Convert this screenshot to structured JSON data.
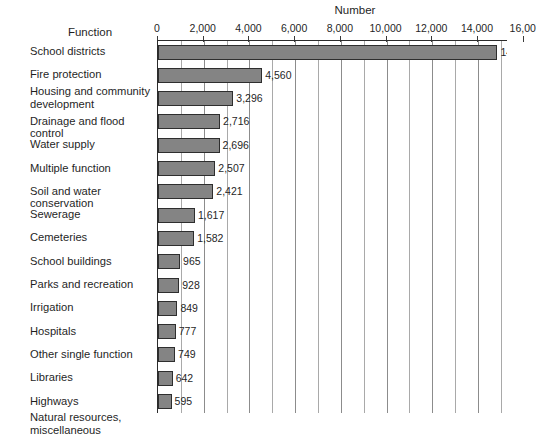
{
  "chart_data": {
    "type": "bar",
    "orientation": "horizontal",
    "title": "",
    "xlabel": "Number",
    "ylabel": "Function",
    "xlim": [
      0,
      16000
    ],
    "grid": true,
    "gridline_step": 1000,
    "tick_step": 2000,
    "legend": "none",
    "tick_labels": [
      "0",
      "2,000",
      "4,000",
      "6,000",
      "8,000",
      "10,000",
      "12,000",
      "14,000",
      "16,00"
    ],
    "tick_values": [
      0,
      2000,
      4000,
      6000,
      8000,
      10000,
      12000,
      14000,
      16000
    ],
    "categories": [
      "School districts",
      "Fire protection",
      "Housing and community development",
      "Drainage and flood control",
      "Water supply",
      "Multiple function",
      "Soil and water conservation",
      "Sewerage",
      "Cemeteries",
      "School buildings",
      "Parks and recreation",
      "Irrigation",
      "Hospitals",
      "Other single function",
      "Libraries",
      "Highways",
      "Natural resources, miscellaneous"
    ],
    "values": [
      14851,
      4560,
      3296,
      2716,
      2696,
      2507,
      2421,
      1617,
      1582,
      965,
      928,
      849,
      777,
      749,
      642,
      595,
      290
    ],
    "value_labels": [
      "14,851",
      "4,560",
      "3,296",
      "2,716",
      "2,696",
      "2,507",
      "2,421",
      "1,617",
      "1,582",
      "965",
      "928",
      "849",
      "777",
      "749",
      "642",
      "595",
      "290"
    ],
    "bars": [
      {
        "label": "School districts",
        "label_lines": [
          "School districts"
        ],
        "value": 14851,
        "value_label": "14,851"
      },
      {
        "label": "Fire protection",
        "label_lines": [
          "Fire protection"
        ],
        "value": 4560,
        "value_label": "4,560"
      },
      {
        "label": "Housing and community development",
        "label_lines": [
          "Housing and community",
          "development"
        ],
        "value": 3296,
        "value_label": "3,296"
      },
      {
        "label": "Drainage and flood control",
        "label_lines": [
          "Drainage and flood control"
        ],
        "value": 2716,
        "value_label": "2,716"
      },
      {
        "label": "Water supply",
        "label_lines": [
          "Water supply"
        ],
        "value": 2696,
        "value_label": "2,696"
      },
      {
        "label": "Multiple function",
        "label_lines": [
          "Multiple function"
        ],
        "value": 2507,
        "value_label": "2,507"
      },
      {
        "label": "Soil and water conservation",
        "label_lines": [
          "Soil and water conservation"
        ],
        "value": 2421,
        "value_label": "2,421"
      },
      {
        "label": "Sewerage",
        "label_lines": [
          "Sewerage"
        ],
        "value": 1617,
        "value_label": "1,617"
      },
      {
        "label": "Cemeteries",
        "label_lines": [
          "Cemeteries"
        ],
        "value": 1582,
        "value_label": "1,582"
      },
      {
        "label": "School buildings",
        "label_lines": [
          "School buildings"
        ],
        "value": 965,
        "value_label": "965"
      },
      {
        "label": "Parks and recreation",
        "label_lines": [
          "Parks and recreation"
        ],
        "value": 928,
        "value_label": "928"
      },
      {
        "label": "Irrigation",
        "label_lines": [
          "Irrigation"
        ],
        "value": 849,
        "value_label": "849"
      },
      {
        "label": "Hospitals",
        "label_lines": [
          "Hospitals"
        ],
        "value": 777,
        "value_label": "777"
      },
      {
        "label": "Other single function",
        "label_lines": [
          "Other single function"
        ],
        "value": 749,
        "value_label": "749"
      },
      {
        "label": "Libraries",
        "label_lines": [
          "Libraries"
        ],
        "value": 642,
        "value_label": "642"
      },
      {
        "label": "Highways",
        "label_lines": [
          "Highways"
        ],
        "value": 595,
        "value_label": "595"
      },
      {
        "label": "Natural resources, miscellaneous",
        "label_lines": [
          "Natural resources,",
          "miscellaneous"
        ],
        "value": 290,
        "value_label": "290"
      }
    ],
    "colors": {
      "bar_fill": "#848484",
      "bar_border": "#2e2e2e",
      "gridline": "#a9a9a9",
      "axis": "#2b2b2b",
      "text": "#1f1f1f",
      "background": "#ffffff"
    }
  }
}
